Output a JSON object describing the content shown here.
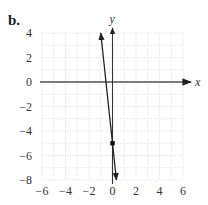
{
  "figure": {
    "panel_label": "b.",
    "x_axis_label": "x",
    "y_axis_label": "y"
  },
  "chart_data": {
    "type": "line",
    "title": "",
    "panel_label": "b.",
    "xlabel": "x",
    "ylabel": "y",
    "xlim": [
      -6,
      6
    ],
    "ylim": [
      -8,
      4
    ],
    "x_ticks": [
      -6,
      -4,
      -2,
      0,
      2,
      4,
      6
    ],
    "y_ticks": [
      -8,
      -6,
      -4,
      -2,
      0,
      2,
      4
    ],
    "grid": true,
    "grid_step": 1,
    "series": [
      {
        "name": "line",
        "equation": "y = -9x - 5",
        "slope": -9,
        "intercept": -5,
        "x": [
          -1,
          0.333
        ],
        "y": [
          4,
          -8
        ],
        "arrows_both_ends": true
      }
    ],
    "points": [
      {
        "x": 0,
        "y": -5,
        "label": ""
      }
    ]
  }
}
